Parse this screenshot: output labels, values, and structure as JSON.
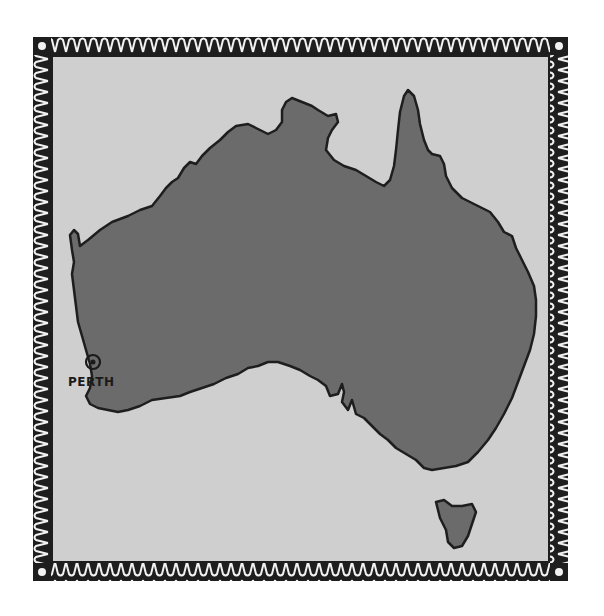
{
  "map": {
    "region": "Australia",
    "colors": {
      "frame": "#1e1e1e",
      "ocean": "#cfcfcf",
      "land": "#6b6b6b",
      "coastline": "#1e1e1e",
      "border_motif": "#f2f2f2"
    },
    "markers": [
      {
        "label": "PERTH",
        "type": "city-circle",
        "x": 93,
        "y": 362
      }
    ]
  }
}
